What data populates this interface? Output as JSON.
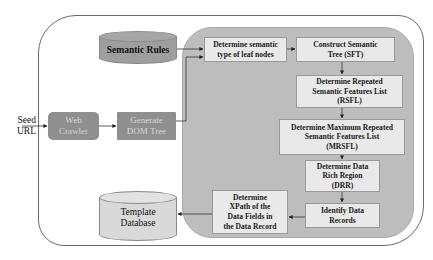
{
  "diagram": {
    "title": "",
    "input": {
      "label": "Seed\nURL"
    },
    "nodes": {
      "semantic_rules": {
        "label": "Semantic Rules",
        "shape": "cylinder",
        "fill": "#9e9e9e"
      },
      "web_crawler": {
        "label": "Web\nCrawler",
        "shape": "rounded-rect",
        "fill": "#8f8f8f"
      },
      "generate_dom": {
        "label": "Generate\nDOM Tree",
        "shape": "rect",
        "fill": "#8f8f8f"
      },
      "semantic_type": {
        "label": "Determine semantic\ntype of leaf nodes"
      },
      "construct_sft": {
        "label": "Construct Semantic\nTree (SFT)"
      },
      "rsfl": {
        "label": "Determine Repeated\nSemantic Features List\n(RSFL)"
      },
      "mrsfl": {
        "label": "Determine Maximum Repeated\nSemantic Features List\n(MRSFL)"
      },
      "drr": {
        "label": "Determine Data\nRich Region\n(DRR)"
      },
      "identify_records": {
        "label": "Identify Data\nRecords"
      },
      "xpath": {
        "label": "Determine\nXPath of the\nData Fields in\nthe Data Record"
      },
      "template_db": {
        "label": "Template\nDatabase",
        "shape": "cylinder",
        "fill": "#d9d9d9"
      }
    },
    "edges": [
      {
        "from": "input",
        "to": "web_crawler"
      },
      {
        "from": "web_crawler",
        "to": "generate_dom"
      },
      {
        "from": "generate_dom",
        "to": "semantic_type"
      },
      {
        "from": "semantic_rules",
        "to": "semantic_type"
      },
      {
        "from": "semantic_type",
        "to": "construct_sft"
      },
      {
        "from": "construct_sft",
        "to": "rsfl"
      },
      {
        "from": "rsfl",
        "to": "mrsfl"
      },
      {
        "from": "mrsfl",
        "to": "drr"
      },
      {
        "from": "drr",
        "to": "identify_records"
      },
      {
        "from": "identify_records",
        "to": "xpath"
      },
      {
        "from": "xpath",
        "to": "template_db"
      }
    ],
    "colors": {
      "panel": "#bdbdbd",
      "box_fill": "#e9e9e9",
      "outer_border": "#6a6a6a"
    }
  }
}
